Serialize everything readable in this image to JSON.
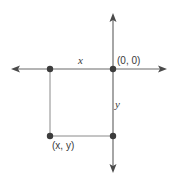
{
  "diagram": {
    "type": "coordinate-axes",
    "colors": {
      "axis": "#6b6b6b",
      "line": "#8a8a8a",
      "point": "#3c3c3c",
      "text": "#3a3a3a"
    },
    "labels": {
      "x_segment": "x",
      "origin": "(0, 0)",
      "y_segment": "y",
      "point": "(x, y)"
    },
    "points": [
      {
        "name": "origin",
        "label": "(0, 0)"
      },
      {
        "name": "x-point",
        "label": ""
      },
      {
        "name": "xy-point",
        "label": "(x, y)"
      },
      {
        "name": "y-point",
        "label": ""
      }
    ]
  }
}
